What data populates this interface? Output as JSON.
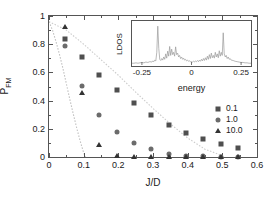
{
  "chart_data": {
    "type": "scatter",
    "title": "",
    "xlabel": "J/D",
    "ylabel": "P_FM",
    "ylabel_base": "P",
    "ylabel_sub": "FM",
    "xlim": [
      0,
      0.6
    ],
    "ylim": [
      0,
      1
    ],
    "xticks": [
      0,
      0.1,
      0.2,
      0.3,
      0.4,
      0.5,
      0.6
    ],
    "xticklabels": [
      "0",
      "0.1",
      "0.2",
      "0.3",
      "0.4",
      "0.5",
      "0.6"
    ],
    "yticks": [
      0,
      0.2,
      0.4,
      0.6,
      0.8,
      1
    ],
    "yticklabels": [
      "0",
      "0.2",
      "0.4",
      "0.6",
      "0.8",
      "1"
    ],
    "grid": false,
    "legend_position": "right",
    "legend_entries": [
      {
        "label": "0.1",
        "marker": "square",
        "color": "#4f4f4f"
      },
      {
        "label": "1.0",
        "marker": "circle",
        "color": "#6b6b6b"
      },
      {
        "label": "10.0",
        "marker": "triangle",
        "color": "#333333"
      }
    ],
    "series": [
      {
        "name": "0.1",
        "marker": "square",
        "color": "#4f4f4f",
        "x": [
          0.047,
          0.095,
          0.145,
          0.195,
          0.245,
          0.295,
          0.345,
          0.395,
          0.445,
          0.495,
          0.545
        ],
        "y": [
          0.84,
          0.71,
          0.585,
          0.478,
          0.385,
          0.298,
          0.23,
          0.172,
          0.127,
          0.09,
          0.065
        ]
      },
      {
        "name": "1.0",
        "marker": "circle",
        "color": "#6b6b6b",
        "x": [
          0.047,
          0.095,
          0.145,
          0.195,
          0.245,
          0.295,
          0.345,
          0.395,
          0.445,
          0.495,
          0.545
        ],
        "y": [
          0.79,
          0.503,
          0.3,
          0.175,
          0.102,
          0.06,
          0.022,
          0.008,
          0.004,
          0.002,
          0.001
        ]
      },
      {
        "name": "10.0",
        "marker": "triangle",
        "color": "#333333",
        "x": [
          0.047,
          0.095,
          0.145,
          0.195,
          0.245,
          0.295,
          0.345,
          0.395,
          0.445,
          0.495,
          0.545
        ],
        "y": [
          0.92,
          0.455,
          0.087,
          0.005,
          0.003,
          0.003,
          0.002,
          0.001,
          0.001,
          0.001,
          0.001
        ]
      }
    ],
    "curves": [
      {
        "name": "steep-dotted-curve",
        "style": "dotted",
        "color": "#bfbfbf",
        "x": [
          0.0,
          0.01,
          0.02,
          0.03,
          0.04,
          0.05,
          0.06,
          0.07,
          0.08,
          0.09,
          0.1,
          0.105
        ],
        "y": [
          0.96,
          0.9,
          0.82,
          0.73,
          0.63,
          0.52,
          0.41,
          0.305,
          0.205,
          0.112,
          0.03,
          0.0
        ]
      },
      {
        "name": "shallow-dotted-curve",
        "style": "dotted",
        "color": "#cccccc",
        "x": [
          0.0,
          0.05,
          0.1,
          0.15,
          0.2,
          0.25,
          0.3,
          0.35,
          0.4,
          0.45,
          0.5
        ],
        "y": [
          0.96,
          0.9,
          0.8,
          0.69,
          0.58,
          0.46,
          0.345,
          0.235,
          0.135,
          0.055,
          0.01
        ]
      }
    ],
    "inset": {
      "type": "line",
      "xlabel": "energy",
      "ylabel": "LDOS",
      "xlim": [
        -0.3,
        0.3
      ],
      "ylim": [
        0,
        1
      ],
      "xticks": [
        -0.25,
        0,
        0.25
      ],
      "xticklabels": [
        "-0.25",
        "0",
        "0.25"
      ],
      "grid": false,
      "color": "#9a9a9a",
      "description": "spiky local density of states with two sharp peaks near energy -0.17 and +0.16",
      "peaks": [
        {
          "energy": -0.17,
          "height": 0.97
        },
        {
          "energy": 0.16,
          "height": 0.8
        }
      ],
      "x": [
        -0.3,
        -0.29,
        -0.28,
        -0.27,
        -0.26,
        -0.25,
        -0.24,
        -0.23,
        -0.22,
        -0.21,
        -0.2,
        -0.195,
        -0.19,
        -0.185,
        -0.18,
        -0.175,
        -0.17,
        -0.165,
        -0.16,
        -0.155,
        -0.15,
        -0.145,
        -0.14,
        -0.135,
        -0.13,
        -0.125,
        -0.12,
        -0.115,
        -0.11,
        -0.105,
        -0.1,
        -0.095,
        -0.09,
        -0.085,
        -0.08,
        -0.075,
        -0.07,
        -0.065,
        -0.06,
        -0.055,
        -0.05,
        -0.045,
        -0.04,
        -0.035,
        -0.03,
        -0.025,
        -0.02,
        -0.015,
        -0.01,
        -0.005,
        0.0,
        0.005,
        0.01,
        0.015,
        0.02,
        0.025,
        0.03,
        0.035,
        0.04,
        0.045,
        0.05,
        0.055,
        0.06,
        0.065,
        0.07,
        0.075,
        0.08,
        0.085,
        0.09,
        0.095,
        0.1,
        0.105,
        0.11,
        0.115,
        0.12,
        0.125,
        0.13,
        0.135,
        0.14,
        0.145,
        0.15,
        0.155,
        0.16,
        0.165,
        0.17,
        0.175,
        0.18,
        0.185,
        0.19,
        0.195,
        0.2,
        0.21,
        0.22,
        0.23,
        0.24,
        0.25,
        0.26,
        0.27,
        0.28,
        0.29,
        0.3
      ],
      "y": [
        0.02,
        0.02,
        0.03,
        0.02,
        0.03,
        0.04,
        0.03,
        0.05,
        0.04,
        0.06,
        0.05,
        0.08,
        0.06,
        0.1,
        0.08,
        0.3,
        0.97,
        0.4,
        0.12,
        0.09,
        0.14,
        0.1,
        0.18,
        0.12,
        0.26,
        0.15,
        0.33,
        0.2,
        0.45,
        0.22,
        0.38,
        0.24,
        0.3,
        0.2,
        0.44,
        0.24,
        0.28,
        0.18,
        0.22,
        0.14,
        0.18,
        0.12,
        0.15,
        0.1,
        0.12,
        0.08,
        0.1,
        0.07,
        0.08,
        0.06,
        0.06,
        0.05,
        0.07,
        0.05,
        0.08,
        0.06,
        0.09,
        0.06,
        0.1,
        0.07,
        0.12,
        0.08,
        0.14,
        0.09,
        0.16,
        0.1,
        0.2,
        0.12,
        0.24,
        0.14,
        0.28,
        0.16,
        0.22,
        0.15,
        0.3,
        0.18,
        0.26,
        0.16,
        0.34,
        0.2,
        0.3,
        0.22,
        0.8,
        0.26,
        0.18,
        0.22,
        0.14,
        0.18,
        0.12,
        0.14,
        0.1,
        0.09,
        0.07,
        0.06,
        0.05,
        0.04,
        0.04,
        0.03,
        0.03,
        0.02,
        0.02
      ]
    }
  }
}
